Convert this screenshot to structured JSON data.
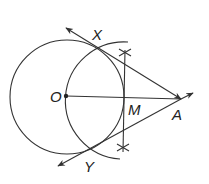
{
  "diagram": {
    "points": {
      "O": {
        "label": "O",
        "x": 66,
        "y": 96
      },
      "M": {
        "label": "M",
        "x": 124,
        "y": 97
      },
      "A": {
        "label": "A",
        "x": 181,
        "y": 99
      },
      "X": {
        "label": "X",
        "x": 98,
        "y": 49
      },
      "Y": {
        "label": "Y",
        "x": 91,
        "y": 147
      }
    },
    "circles": [
      {
        "name": "circle-O",
        "cx": 67,
        "cy": 97,
        "r": 57
      },
      {
        "name": "circle-M",
        "cx": 124,
        "cy": 97,
        "r": 58
      }
    ],
    "segments": [
      "OA",
      "bisector of OA through M"
    ],
    "rays": [
      "AX",
      "AY"
    ],
    "colors": {
      "stroke": "#333333",
      "label": "#222222",
      "background": "#ffffff"
    }
  }
}
